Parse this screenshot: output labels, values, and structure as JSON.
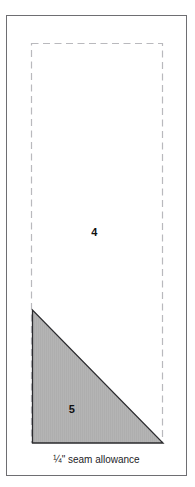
{
  "figure": {
    "caption": "¼\" seam allowance",
    "pieces": [
      {
        "id": "piece-4",
        "label": "4",
        "shape": "rectangle",
        "fill": "#ffffff"
      },
      {
        "id": "piece-5",
        "label": "5",
        "shape": "right-triangle",
        "fill": "#b3b3b3"
      }
    ],
    "colors": {
      "background": "#ffffff",
      "frame_stroke": "#6e6e72",
      "dashed_stroke": "#b9b9bd",
      "triangle_fill": "#b3b3b3",
      "triangle_stroke": "#2b2b2e",
      "text": "#101010"
    },
    "geometry": {
      "frame": {
        "x": 6,
        "y": 15,
        "width": 181,
        "height": 461
      },
      "dashed_rect": {
        "x": 31,
        "y": 43,
        "width": 132,
        "height": 400
      },
      "triangle_points": "32,310 32,443 163,443"
    }
  }
}
